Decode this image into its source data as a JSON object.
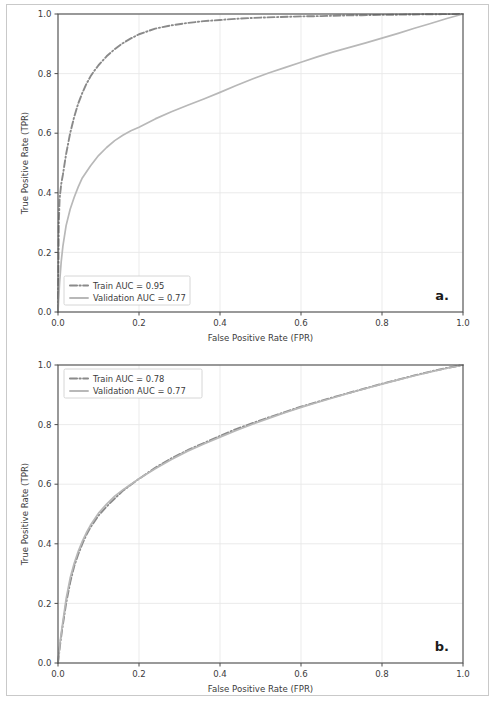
{
  "figure": {
    "background": "#ffffff",
    "frame_color": "#c9c9c9"
  },
  "colors": {
    "train": "#8a8a8a",
    "validation": "#b8b8b8",
    "axis": "#4d4d4d",
    "grid": "#e9e9e9",
    "text": "#3b3b3b"
  },
  "panels": [
    {
      "tag": "a.",
      "xlabel": "False Positive Rate (FPR)",
      "ylabel": "True Positive Rate (TPR)",
      "xticks": [
        "0.0",
        "0.2",
        "0.4",
        "0.6",
        "0.8",
        "1.0"
      ],
      "yticks": [
        "0.0",
        "0.2",
        "0.4",
        "0.6",
        "0.8",
        "1.0"
      ],
      "legend": [
        {
          "label": "Train AUC = 0.95",
          "series": "train"
        },
        {
          "label": "Validation AUC = 0.77",
          "series": "validation"
        }
      ]
    },
    {
      "tag": "b.",
      "xlabel": "False Positive Rate (FPR)",
      "ylabel": "True Positive Rate (TPR)",
      "xticks": [
        "0.0",
        "0.2",
        "0.4",
        "0.6",
        "0.8",
        "1.0"
      ],
      "yticks": [
        "0.0",
        "0.2",
        "0.4",
        "0.6",
        "0.8",
        "1.0"
      ],
      "legend": [
        {
          "label": "Train AUC = 0.78",
          "series": "train"
        },
        {
          "label": "Validation AUC = 0.77",
          "series": "validation"
        }
      ]
    }
  ],
  "chart_data": [
    {
      "type": "line",
      "title": "",
      "panel_tag": "a.",
      "xlabel": "False Positive Rate (FPR)",
      "ylabel": "True Positive Rate (TPR)",
      "xlim": [
        0.0,
        1.0
      ],
      "ylim": [
        0.0,
        1.0
      ],
      "xticks": [
        0.0,
        0.2,
        0.4,
        0.6,
        0.8,
        1.0
      ],
      "yticks": [
        0.0,
        0.2,
        0.4,
        0.6,
        0.8,
        1.0
      ],
      "grid": true,
      "legend_position": "lower left",
      "annotations": [
        "a."
      ],
      "series": [
        {
          "name": "Train AUC = 0.95",
          "auc": 0.95,
          "linestyle": "dashdot",
          "color": "#8a8a8a",
          "x": [
            0.0,
            0.002,
            0.004,
            0.008,
            0.012,
            0.02,
            0.03,
            0.04,
            0.05,
            0.06,
            0.07,
            0.08,
            0.09,
            0.1,
            0.12,
            0.14,
            0.16,
            0.18,
            0.2,
            0.24,
            0.28,
            0.32,
            0.36,
            0.4,
            0.45,
            0.5,
            0.55,
            0.6,
            0.65,
            0.7,
            0.75,
            0.8,
            0.85,
            0.9,
            0.95,
            1.0
          ],
          "y": [
            0.0,
            0.3,
            0.38,
            0.43,
            0.46,
            0.53,
            0.6,
            0.655,
            0.7,
            0.735,
            0.765,
            0.79,
            0.81,
            0.828,
            0.858,
            0.882,
            0.902,
            0.918,
            0.932,
            0.951,
            0.962,
            0.97,
            0.976,
            0.98,
            0.985,
            0.988,
            0.99,
            0.992,
            0.993,
            0.995,
            0.996,
            0.997,
            0.998,
            0.999,
            0.9995,
            1.0
          ]
        },
        {
          "name": "Validation AUC = 0.77",
          "auc": 0.77,
          "linestyle": "solid",
          "color": "#b8b8b8",
          "x": [
            0.0,
            0.004,
            0.008,
            0.012,
            0.02,
            0.03,
            0.04,
            0.05,
            0.06,
            0.08,
            0.1,
            0.12,
            0.14,
            0.16,
            0.18,
            0.2,
            0.24,
            0.28,
            0.32,
            0.36,
            0.4,
            0.44,
            0.48,
            0.52,
            0.56,
            0.6,
            0.64,
            0.68,
            0.72,
            0.76,
            0.8,
            0.84,
            0.88,
            0.92,
            0.96,
            1.0
          ],
          "y": [
            0.0,
            0.1,
            0.17,
            0.22,
            0.29,
            0.345,
            0.385,
            0.42,
            0.45,
            0.49,
            0.525,
            0.552,
            0.575,
            0.593,
            0.608,
            0.62,
            0.648,
            0.672,
            0.694,
            0.715,
            0.737,
            0.76,
            0.782,
            0.802,
            0.82,
            0.838,
            0.856,
            0.873,
            0.888,
            0.903,
            0.919,
            0.935,
            0.952,
            0.968,
            0.985,
            1.0
          ]
        }
      ]
    },
    {
      "type": "line",
      "title": "",
      "panel_tag": "b.",
      "xlabel": "False Positive Rate (FPR)",
      "ylabel": "True Positive Rate (TPR)",
      "xlim": [
        0.0,
        1.0
      ],
      "ylim": [
        0.0,
        1.0
      ],
      "xticks": [
        0.0,
        0.2,
        0.4,
        0.6,
        0.8,
        1.0
      ],
      "yticks": [
        0.0,
        0.2,
        0.4,
        0.6,
        0.8,
        1.0
      ],
      "grid": true,
      "legend_position": "upper left",
      "annotations": [
        "b."
      ],
      "series": [
        {
          "name": "Train AUC = 0.78",
          "auc": 0.78,
          "linestyle": "dashdot",
          "color": "#8a8a8a",
          "x": [
            0.0,
            0.005,
            0.01,
            0.02,
            0.03,
            0.04,
            0.05,
            0.06,
            0.07,
            0.08,
            0.1,
            0.12,
            0.14,
            0.16,
            0.18,
            0.2,
            0.24,
            0.28,
            0.32,
            0.36,
            0.4,
            0.44,
            0.48,
            0.52,
            0.56,
            0.6,
            0.64,
            0.68,
            0.72,
            0.76,
            0.8,
            0.84,
            0.88,
            0.92,
            0.96,
            1.0
          ],
          "y": [
            0.0,
            0.06,
            0.11,
            0.2,
            0.27,
            0.325,
            0.365,
            0.4,
            0.43,
            0.455,
            0.495,
            0.525,
            0.552,
            0.578,
            0.598,
            0.618,
            0.655,
            0.687,
            0.714,
            0.738,
            0.762,
            0.785,
            0.805,
            0.824,
            0.842,
            0.86,
            0.876,
            0.892,
            0.907,
            0.922,
            0.937,
            0.951,
            0.965,
            0.978,
            0.99,
            1.0
          ]
        },
        {
          "name": "Validation AUC = 0.77",
          "auc": 0.77,
          "linestyle": "solid",
          "color": "#b8b8b8",
          "x": [
            0.0,
            0.005,
            0.01,
            0.02,
            0.03,
            0.04,
            0.05,
            0.06,
            0.07,
            0.08,
            0.1,
            0.12,
            0.14,
            0.16,
            0.18,
            0.2,
            0.24,
            0.28,
            0.32,
            0.36,
            0.4,
            0.44,
            0.48,
            0.52,
            0.56,
            0.6,
            0.64,
            0.68,
            0.72,
            0.76,
            0.8,
            0.84,
            0.88,
            0.92,
            0.96,
            1.0
          ],
          "y": [
            0.0,
            0.07,
            0.12,
            0.215,
            0.285,
            0.335,
            0.375,
            0.408,
            0.437,
            0.462,
            0.503,
            0.533,
            0.56,
            0.581,
            0.6,
            0.618,
            0.652,
            0.683,
            0.711,
            0.735,
            0.758,
            0.78,
            0.801,
            0.821,
            0.84,
            0.858,
            0.874,
            0.89,
            0.906,
            0.921,
            0.936,
            0.95,
            0.964,
            0.977,
            0.989,
            1.0
          ]
        }
      ]
    }
  ]
}
